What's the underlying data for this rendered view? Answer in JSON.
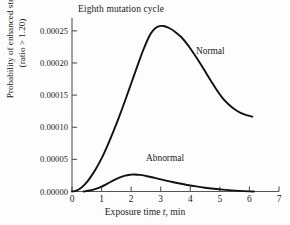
{
  "chart_data": {
    "type": "line",
    "title": "Eighth mutation cycle",
    "xlabel_plain": "Exposure time t, min",
    "xlabel_prefix": "Exposure time ",
    "xlabel_italic": "t",
    "xlabel_suffix": ", min",
    "ylabel_line1": "Probability of enhanced strain",
    "ylabel_line2": "(ratio > 1.20)",
    "xlim": [
      0,
      7
    ],
    "ylim": [
      0,
      0.00027
    ],
    "grid": false,
    "legend_position": "inline-curve-labels",
    "xticks": [
      0,
      1,
      2,
      3,
      4,
      5,
      6,
      7
    ],
    "xtick_labels": [
      "0",
      "1",
      "2",
      "3",
      "4",
      "5",
      "6",
      "7"
    ],
    "yticks": [
      0,
      5e-05,
      0.0001,
      0.00015,
      0.0002,
      0.00025
    ],
    "ytick_labels": [
      "0.00000",
      "0.00005",
      "0.00010",
      "0.00015",
      "0.00020",
      "0.00025"
    ],
    "line_color": "#111111",
    "axis_color": "#555555",
    "series": [
      {
        "name": "Normal",
        "label": "Normal",
        "x": [
          0.0,
          0.15,
          0.3,
          0.45,
          0.6,
          0.8,
          1.0,
          1.2,
          1.4,
          1.6,
          1.8,
          2.0,
          2.2,
          2.4,
          2.6,
          2.75,
          2.9,
          3.1,
          3.3,
          3.5,
          3.7,
          3.9,
          4.1,
          4.3,
          4.5,
          4.7,
          4.9,
          5.1,
          5.3,
          5.5,
          5.7,
          5.9,
          6.1
        ],
        "values": [
          0.0,
          1.5e-06,
          5.5e-06,
          1.2e-05,
          2.05e-05,
          3.45e-05,
          5.15e-05,
          7.15e-05,
          9.35e-05,
          0.000117,
          0.000142,
          0.000168,
          0.000194,
          0.000219,
          0.0002405,
          0.000251,
          0.0002565,
          0.0002575,
          0.000254,
          0.000248,
          0.00024,
          0.000229,
          0.000216,
          0.000202,
          0.000187,
          0.000172,
          0.0001575,
          0.000145,
          0.0001355,
          0.000128,
          0.0001225,
          0.000119,
          0.0001165
        ]
      },
      {
        "name": "Abnormal",
        "label": "Abnormal",
        "x": [
          0.4,
          0.6,
          0.8,
          1.0,
          1.2,
          1.4,
          1.6,
          1.8,
          2.0,
          2.1,
          2.3,
          2.5,
          2.7,
          2.9,
          3.1,
          3.3,
          3.6,
          3.9,
          4.2,
          4.5,
          4.8,
          5.1,
          5.4,
          5.7,
          6.0,
          6.15
        ],
        "values": [
          0.0,
          1.5e-06,
          4e-06,
          7.5e-06,
          1.22e-05,
          1.72e-05,
          2.15e-05,
          2.48e-05,
          2.62e-05,
          2.64e-05,
          2.58e-05,
          2.42e-05,
          2.22e-05,
          2e-05,
          1.78e-05,
          1.58e-05,
          1.28e-05,
          1.02e-05,
          7.9e-06,
          5.9e-06,
          4.3e-06,
          2.9e-06,
          1.8e-06,
          9e-07,
          2e-07,
          0.0
        ]
      }
    ]
  }
}
